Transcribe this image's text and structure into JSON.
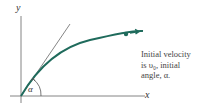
{
  "diagram": {
    "axes": {
      "x_label": "x",
      "y_label": "y"
    },
    "angle_label": "α",
    "caption": {
      "line1": "Initial velocity",
      "line2": "is υ₀, initial",
      "line3": "angle, α."
    },
    "colors": {
      "trajectory": "#1f6b5c",
      "axes": "#555555",
      "tangent": "#555555",
      "text": "#444444"
    }
  }
}
